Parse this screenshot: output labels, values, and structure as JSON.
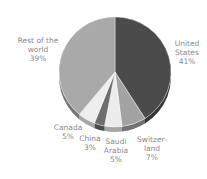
{
  "chart_data": {
    "type": "pie",
    "title": "",
    "style": "3d",
    "start_angle": "12 o'clock, clockwise",
    "categories": [
      "United States",
      "Switzerland",
      "Saudi Arabia",
      "China",
      "Canada",
      "Rest of the world"
    ],
    "values": [
      41,
      7,
      5,
      3,
      5,
      39
    ],
    "unit": "%",
    "colors": [
      "#4b4b4b",
      "#a3a3a3",
      "#ececec",
      "#6e6e6e",
      "#eeeeee",
      "#a9a9a9"
    ],
    "labels": [
      {
        "text": "United\nStates\n41%",
        "x": 187,
        "y": 43
      },
      {
        "text": "Switzer-\nland\n7%",
        "x": 152,
        "y": 139
      },
      {
        "text": "Saudi\nArabia\n5%",
        "x": 116,
        "y": 141
      },
      {
        "text": "China\n3%",
        "x": 90,
        "y": 138
      },
      {
        "text": "Canada\n5%",
        "x": 68,
        "y": 127
      },
      {
        "text": "Rest of the\nworld\n39%",
        "x": 38,
        "y": 40
      }
    ],
    "legend": "none",
    "grid": false
  }
}
